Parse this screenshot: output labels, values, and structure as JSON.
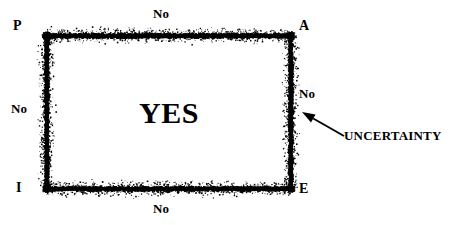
{
  "figure": {
    "background_color": "#ffffff",
    "ink_color": "#000000",
    "width": 469,
    "height": 225
  },
  "corners": {
    "top_left": "P",
    "top_right": "A",
    "bottom_left": "I",
    "bottom_right": "E"
  },
  "region_labels": {
    "center": "YES",
    "top": "No",
    "bottom": "No",
    "left": "No",
    "right": "No"
  },
  "annotation": {
    "label": "UNCERTAINTY",
    "arrow": {
      "tail_x": 344,
      "tail_y": 136,
      "head_x": 302,
      "head_y": 112
    }
  },
  "rectangle": {
    "left": 46,
    "top": 35,
    "right": 290,
    "bottom": 188,
    "border_style": "speckled-noisy-band",
    "border_thickness": 9,
    "noise_spread": 7
  },
  "chart_data": {
    "type": "diagram",
    "title": "",
    "corner_points": [
      {
        "label": "P",
        "x": 46,
        "y": 35
      },
      {
        "label": "A",
        "x": 290,
        "y": 35
      },
      {
        "label": "E",
        "x": 290,
        "y": 188
      },
      {
        "label": "I",
        "x": 46,
        "y": 188
      }
    ],
    "regions": [
      {
        "name": "interior",
        "value": "YES"
      },
      {
        "name": "exterior-top",
        "value": "No"
      },
      {
        "name": "exterior-bottom",
        "value": "No"
      },
      {
        "name": "exterior-left",
        "value": "No"
      },
      {
        "name": "exterior-right",
        "value": "No"
      },
      {
        "name": "boundary-band",
        "value": "UNCERTAINTY"
      }
    ]
  }
}
